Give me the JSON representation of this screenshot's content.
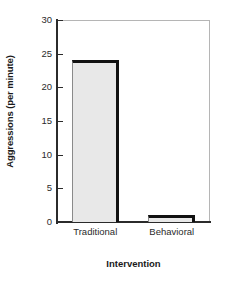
{
  "chart_data": {
    "type": "bar",
    "title": "",
    "subtitle": "",
    "xlabel": "Intervention",
    "ylabel": "Aggressions (per minute)",
    "categories": [
      "Traditional",
      "Behavioral"
    ],
    "values": [
      24,
      1
    ],
    "series": [
      {
        "name": "Aggressions (per minute)",
        "values": [
          24,
          1
        ]
      }
    ],
    "ylim": [
      0,
      30
    ],
    "yticks": [
      0,
      5,
      10,
      15,
      20,
      25,
      30
    ],
    "ytick_labels": [
      "0",
      "5",
      "10",
      "15",
      "20",
      "25",
      "30"
    ],
    "grid": false,
    "legend": false,
    "legend_position": "none",
    "bar_fill_color": "#e8e8e8",
    "bar_edge_color": "#111111",
    "axis_color": "#2b2b2b",
    "frame_color": "#b5b5b5",
    "background_color": "#ffffff"
  }
}
